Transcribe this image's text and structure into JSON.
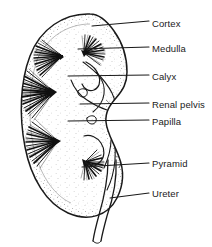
{
  "figure": {
    "style": "black-and-white line drawing with stipple and hatching",
    "ink_color": "#1a1a1a",
    "background_color": "#ffffff"
  },
  "labels": [
    {
      "id": "cortex",
      "text": "Cortex",
      "x": 152,
      "y": 18,
      "leader": {
        "x1": 92,
        "y1": 26,
        "x2": 149,
        "y2": 21
      }
    },
    {
      "id": "medulla",
      "text": "Medulla",
      "x": 152,
      "y": 43,
      "leader": {
        "x1": 78,
        "y1": 49,
        "x2": 149,
        "y2": 47
      }
    },
    {
      "id": "calyx",
      "text": "Calyx",
      "x": 152,
      "y": 71,
      "leader": {
        "x1": 68,
        "y1": 76,
        "x2": 149,
        "y2": 75
      }
    },
    {
      "id": "renal-pelvis",
      "text": "Renal pelvis",
      "x": 152,
      "y": 99,
      "leader": {
        "x1": 80,
        "y1": 104,
        "x2": 149,
        "y2": 103
      }
    },
    {
      "id": "papilla",
      "text": "Papilla",
      "x": 152,
      "y": 116,
      "leader": {
        "x1": 68,
        "y1": 121,
        "x2": 149,
        "y2": 120
      }
    },
    {
      "id": "pyramid",
      "text": "Pyramid",
      "x": 152,
      "y": 158,
      "leader": {
        "x1": 82,
        "y1": 167,
        "x2": 149,
        "y2": 163
      }
    },
    {
      "id": "ureter",
      "text": "Ureter",
      "x": 152,
      "y": 188,
      "leader": {
        "x1": 110,
        "y1": 198,
        "x2": 149,
        "y2": 193
      }
    }
  ],
  "structures": [
    {
      "id": "renal-capsule-outline",
      "name": "Kidney outer capsule (bean-shaped outline)"
    },
    {
      "id": "renal-cortex-band",
      "name": "Cortex: stippled outer band"
    },
    {
      "id": "medullary-pyramids",
      "name": "Medullary pyramids: dark radiating striations"
    },
    {
      "id": "renal-papilla",
      "name": "Papilla: pyramid apex projecting into calyx"
    },
    {
      "id": "minor-calyx",
      "name": "Calyx: cup-shaped collecting space"
    },
    {
      "id": "renal-pelvis-cavity",
      "name": "Renal pelvis: funnel-shaped central cavity"
    },
    {
      "id": "renal-hilum",
      "name": "Hilum: medial indentation"
    },
    {
      "id": "ureter-tube",
      "name": "Ureter: tube descending from pelvis"
    }
  ]
}
